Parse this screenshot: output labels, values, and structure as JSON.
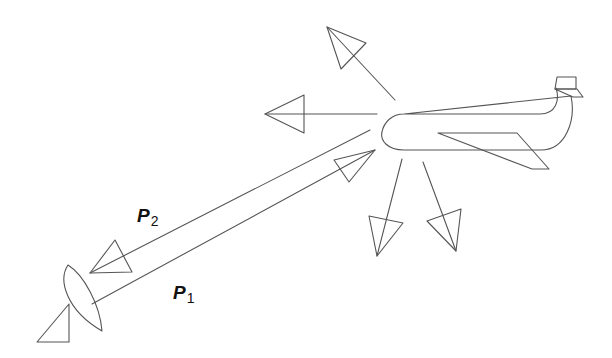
{
  "diagram": {
    "title": "",
    "nodes": [
      {
        "id": "antenna",
        "label": "",
        "icon": "radar-dish-icon"
      },
      {
        "id": "aircraft",
        "label": "",
        "icon": "airplane-icon"
      }
    ],
    "edges": [
      {
        "from": "antenna",
        "to": "aircraft",
        "label": "P1",
        "label_base": "P",
        "label_sub": "1"
      },
      {
        "from": "aircraft",
        "to": "antenna",
        "label": "P2",
        "label_base": "P",
        "label_sub": "2"
      }
    ],
    "scatter_arrows": [
      "up-left",
      "left",
      "down-left",
      "down"
    ],
    "line_color": "#555555"
  }
}
